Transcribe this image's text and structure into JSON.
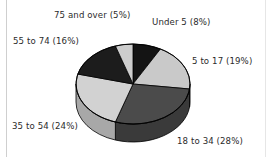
{
  "figure": {
    "background_color": "#ffffff",
    "border_color": "#cfcfcf"
  },
  "chart_data": {
    "type": "pie",
    "title": "",
    "subtitle": "",
    "xlabel": "",
    "ylabel": "",
    "grid": false,
    "legend_position": "none",
    "label_format": "{category} ({value}%)",
    "three_d": true,
    "start_angle_deg": 0,
    "direction": "clockwise",
    "categories": [
      "Under 5",
      "5 to 17",
      "18 to 34",
      "35 to 54",
      "55 to 74",
      "75 and over"
    ],
    "values": [
      8,
      19,
      28,
      24,
      16,
      5
    ],
    "colors": [
      "#141414",
      "#c9c9c9",
      "#4b4b4b",
      "#d2d2d2",
      "#1c1c1c",
      "#cdcdcd"
    ],
    "side_colors": [
      "#0d0d0d",
      "#a0a0a0",
      "#3a3a3a",
      "#a8a8a8",
      "#141414",
      "#a4a4a4"
    ],
    "annotations": [
      "Under 5  (8%)",
      "5 to 17 (19%)",
      "18 to 34 (28%)",
      "35 to 54 (24%)",
      "55 to 74 (16%)",
      "75 and over (5%)"
    ]
  },
  "labels": {
    "under_5": "Under 5  (8%)",
    "age_5_17": "5 to 17 (19%)",
    "age_18_34": "18 to 34 (28%)",
    "age_35_54": "35 to 54 (24%)",
    "age_55_74": "55 to 74 (16%)",
    "age_75_over": "75 and over (5%)"
  }
}
